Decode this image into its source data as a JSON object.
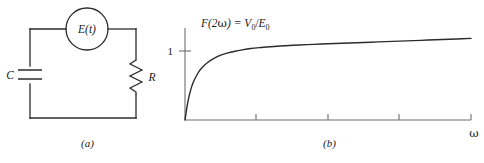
{
  "figure": {
    "background": "#ffffff",
    "ink": "#2b2b2b",
    "axis_color": "#6e6e6e"
  },
  "panel_a": {
    "caption": "(a)",
    "type": "circuit-diagram",
    "components": [
      {
        "name": "voltage-source",
        "label": "E(t)",
        "symbol": "circle"
      },
      {
        "name": "capacitor",
        "label": "C",
        "symbol": "parallel-plates"
      },
      {
        "name": "resistor",
        "label": "R",
        "symbol": "zigzag"
      }
    ],
    "source_label": "E(t)",
    "capacitor_label": "C",
    "resistor_label": "R"
  },
  "panel_b": {
    "caption": "(b)",
    "annotation": {
      "prefix": "F(2",
      "omega": "ω",
      "middle": ") = ",
      "v": "V",
      "v_sub": "0",
      "slash": "/",
      "e": "E",
      "e_sub": "0"
    },
    "y_tick_label": "1",
    "x_axis_label": "ω"
  },
  "chart_data": {
    "type": "line",
    "title": "F(2ω) = V0/E0",
    "xlabel": "ω",
    "ylabel": "",
    "grid": false,
    "legend": false,
    "xlim": [
      0,
      10
    ],
    "ylim": [
      0,
      1.22
    ],
    "y_ticks": [
      1
    ],
    "y_tick_labels": [
      "1"
    ],
    "x_ticks": [
      2.5,
      5.0,
      7.5,
      10.0
    ],
    "x_tick_labels": [
      "",
      "",
      "",
      ""
    ],
    "series": [
      {
        "name": "F(2ω)",
        "x": [
          0.0,
          0.1,
          0.2,
          0.3,
          0.45,
          0.6,
          0.8,
          1.0,
          1.25,
          1.5,
          1.75,
          2.0,
          2.3,
          2.6,
          3.0,
          3.5,
          4.0,
          4.5,
          5.0,
          5.5,
          6.0,
          6.5,
          7.0,
          7.5,
          8.0,
          8.5,
          9.0,
          9.5,
          10.0
        ],
        "y": [
          0.0,
          0.24,
          0.4,
          0.51,
          0.62,
          0.695,
          0.765,
          0.815,
          0.86,
          0.89,
          0.912,
          0.93,
          0.948,
          0.96,
          0.972,
          0.985,
          0.995,
          1.003,
          1.011,
          1.018,
          1.025,
          1.032,
          1.039,
          1.046,
          1.053,
          1.06,
          1.067,
          1.074,
          1.082
        ]
      }
    ]
  }
}
